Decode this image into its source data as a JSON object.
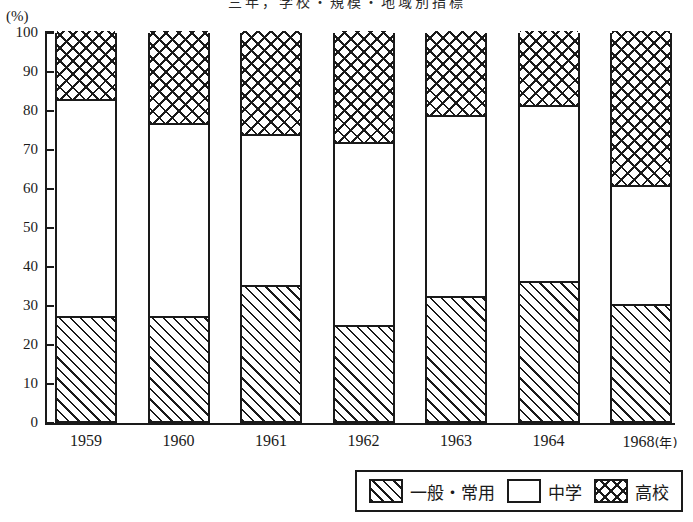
{
  "chart_data": {
    "type": "bar",
    "stacked": true,
    "stack_total": 100,
    "title": "三年，学校・規模・地域別指標",
    "xlabel": "",
    "ylabel": "",
    "yunit": "(%)",
    "x_unit_label": "(年)",
    "ylim": [
      0,
      100
    ],
    "ytick_step": 10,
    "yticks": [
      100,
      90,
      80,
      70,
      60,
      50,
      40,
      30,
      20,
      10,
      0
    ],
    "grid": false,
    "legend_position": "bottom-right",
    "categories": [
      "1959",
      "1960",
      "1961",
      "1962",
      "1963",
      "1964",
      "1968"
    ],
    "series": [
      {
        "name": "一般・常用",
        "pattern": "diagonal-hatch",
        "values": [
          27,
          27,
          35,
          24.5,
          32,
          36,
          30
        ]
      },
      {
        "name": "中学",
        "pattern": "solid-white",
        "values": [
          55,
          49,
          38,
          46.5,
          46,
          44.5,
          30
        ]
      },
      {
        "name": "高校",
        "pattern": "cross-hatch",
        "values": [
          18,
          24,
          27,
          29,
          22,
          19.5,
          40
        ]
      }
    ],
    "cumulative_boundaries": [
      {
        "category": "1959",
        "lower": 27,
        "upper": 82
      },
      {
        "category": "1960",
        "lower": 27,
        "upper": 76
      },
      {
        "category": "1961",
        "lower": 35,
        "upper": 73
      },
      {
        "category": "1962",
        "lower": 24.5,
        "upper": 71
      },
      {
        "category": "1963",
        "lower": 32,
        "upper": 78
      },
      {
        "category": "1964",
        "lower": 36,
        "upper": 80.5
      },
      {
        "category": "1968",
        "lower": 30,
        "upper": 60
      }
    ]
  },
  "colors": {
    "ink": "#1a1a1a",
    "background": "#ffffff"
  }
}
